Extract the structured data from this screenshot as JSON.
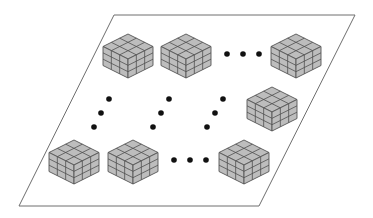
{
  "diagram": {
    "plane": {
      "points": [
        [
          114,
          15
        ],
        [
          355,
          15
        ],
        [
          259,
          206
        ],
        [
          19,
          206
        ]
      ],
      "stroke": "#6e6e6e",
      "fill": "#ffffff"
    },
    "cube_style": {
      "fill": "#bdbdbd",
      "grid_stroke": "#4f4f4f",
      "outline_stroke": "#555555",
      "grid_divisions": 3,
      "half_width": 25,
      "top_half_height": 12.5,
      "side_height": 19
    },
    "cubes": [
      {
        "id": "cube-row1-col1",
        "cx": 128,
        "cy": 56
      },
      {
        "id": "cube-row1-col2",
        "cx": 186,
        "cy": 56
      },
      {
        "id": "cube-row1-last",
        "cx": 296,
        "cy": 56
      },
      {
        "id": "cube-row-mid-last",
        "cx": 272,
        "cy": 109
      },
      {
        "id": "cube-rowN-col1",
        "cx": 74,
        "cy": 162
      },
      {
        "id": "cube-rowN-col2",
        "cx": 133,
        "cy": 162
      },
      {
        "id": "cube-rowN-last",
        "cx": 244,
        "cy": 162
      }
    ],
    "ellipses": [
      {
        "id": "ellipsis-top-horizontal",
        "dots": [
          [
            227,
            54
          ],
          [
            243,
            54
          ],
          [
            259,
            54
          ]
        ]
      },
      {
        "id": "ellipsis-col1-vertical",
        "dots": [
          [
            109,
            99
          ],
          [
            101,
            113
          ],
          [
            94,
            127
          ]
        ]
      },
      {
        "id": "ellipsis-col2-vertical",
        "dots": [
          [
            169,
            99
          ],
          [
            161,
            113
          ],
          [
            153,
            127
          ]
        ]
      },
      {
        "id": "ellipsis-col3-vertical",
        "dots": [
          [
            223,
            99
          ],
          [
            215,
            113
          ],
          [
            207,
            127
          ]
        ]
      },
      {
        "id": "ellipsis-bottom-horizontal",
        "dots": [
          [
            174,
            160
          ],
          [
            190,
            160
          ],
          [
            206,
            160
          ]
        ]
      }
    ],
    "dot_radius": 2.8,
    "dot_color": "#111111"
  }
}
